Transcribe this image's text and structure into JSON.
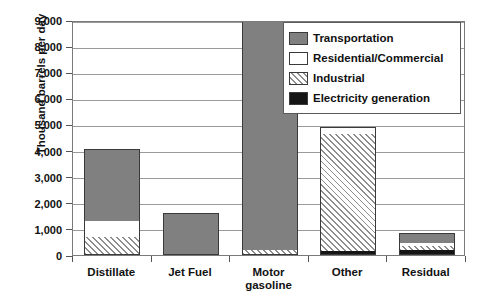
{
  "chart_data": {
    "type": "bar",
    "title": "",
    "subtitle": "",
    "xlabel": "",
    "ylabel": "Thousand barrels per day",
    "ylim": [
      0,
      9000
    ],
    "ytick_labels": [
      "0",
      "1,000",
      "2,000",
      "3,000",
      "4,000",
      "5,000",
      "6,000",
      "7,000",
      "8,000",
      "9,000"
    ],
    "ytick_values": [
      0,
      1000,
      2000,
      3000,
      4000,
      5000,
      6000,
      7000,
      8000,
      9000
    ],
    "grid": true,
    "stacked": true,
    "legend_position": "top-right",
    "categories": [
      "Distillate",
      "Jet Fuel",
      "Motor gasoline",
      "Other",
      "Residual"
    ],
    "series": [
      {
        "name": "Transportation",
        "color": "#808080",
        "pattern": "solid",
        "values": [
          2750,
          1600,
          8850,
          0,
          400
        ]
      },
      {
        "name": "Residential/Commercial",
        "color": "#ffffff",
        "pattern": "solid",
        "values": [
          600,
          0,
          0,
          250,
          100
        ]
      },
      {
        "name": "Industrial",
        "color": "#ffffff",
        "pattern": "diagonal-hatch",
        "values": [
          700,
          0,
          200,
          4500,
          150
        ]
      },
      {
        "name": "Electricity generation",
        "color": "#151515",
        "pattern": "solid",
        "values": [
          0,
          0,
          0,
          150,
          200
        ]
      }
    ],
    "totals": [
      4050,
      1600,
      9050,
      4900,
      850
    ]
  },
  "axes": {
    "y_title": "Thousand barrels per day"
  },
  "legend": {
    "items": [
      {
        "label": "Transportation",
        "swatch": "transportation-swatch"
      },
      {
        "label": "Residential/Commercial",
        "swatch": "residential-commercial-swatch"
      },
      {
        "label": "Industrial",
        "swatch": "industrial-swatch"
      },
      {
        "label": "Electricity generation",
        "swatch": "electricity-generation-swatch"
      }
    ]
  },
  "categories_display": [
    {
      "line1": "Distillate",
      "line2": ""
    },
    {
      "line1": "Jet Fuel",
      "line2": ""
    },
    {
      "line1": "Motor",
      "line2": "gasoline"
    },
    {
      "line1": "Other",
      "line2": ""
    },
    {
      "line1": "Residual",
      "line2": ""
    }
  ]
}
